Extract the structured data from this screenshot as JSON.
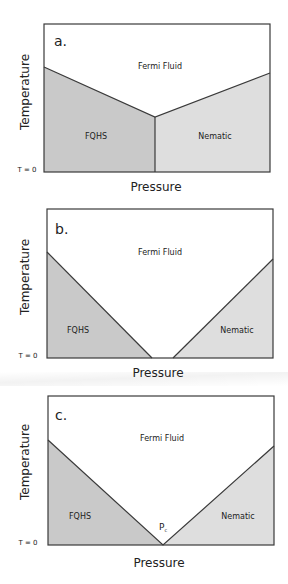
{
  "colors": {
    "fqhs_fill": "#c9c9c9",
    "nematic_fill": "#dedede",
    "fluid_fill": "#ffffff",
    "stroke": "#3a3a3a"
  },
  "axis_labels": {
    "y": "Temperature",
    "x": "Pressure",
    "t_zero": "T = 0"
  },
  "panels": [
    {
      "label": "a.",
      "regions": {
        "top": "Fermi Fluid",
        "left": "FQHS",
        "right": "Nematic"
      },
      "description": "FQHS and Nematic phases meet at a vertical first-order boundary; both bounded above by Fermi Fluid."
    },
    {
      "label": "b.",
      "regions": {
        "top": "Fermi Fluid",
        "left": "FQHS",
        "right": "Nematic"
      },
      "description": "FQHS and Nematic phases separated by Fermi Fluid down to T = 0."
    },
    {
      "label": "c.",
      "regions": {
        "top": "Fermi Fluid",
        "left": "FQHS",
        "right": "Nematic"
      },
      "critical_point": {
        "label": "P",
        "subscript": "c"
      },
      "description": "FQHS and Nematic phases meet at a single quantum critical point Pc at T = 0."
    }
  ]
}
